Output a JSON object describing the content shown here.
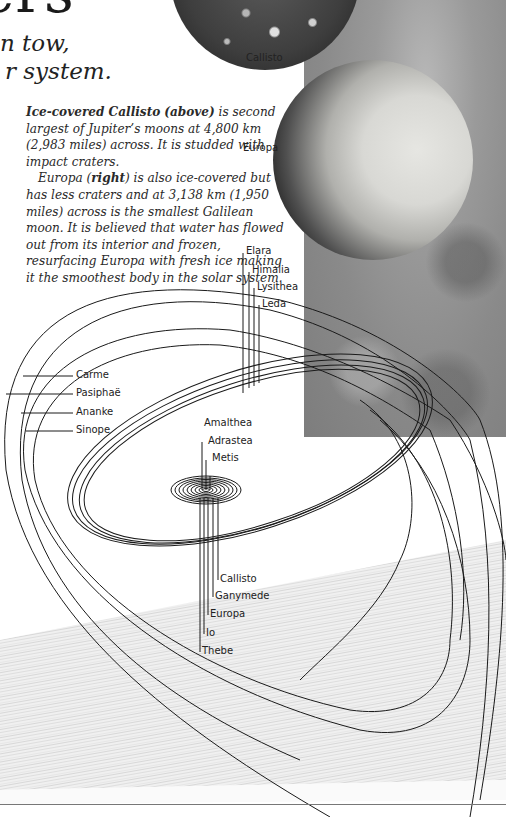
{
  "page": {
    "heading_fragment": "ers",
    "subtitle_lines": [
      "n tow,",
      "r system."
    ]
  },
  "body_text": {
    "para1": {
      "bold": "Ice-covered Callisto",
      "bold2": "(above)",
      "rest": " is second largest of Jupiter’s moons at 4,800 km (2,983 miles) across. It is studded with impact craters."
    },
    "para2": {
      "start": "Europa (",
      "bold": "right",
      "rest": ") is also ice-covered but has less craters and at 3,138 km (1,950 miles) across is the smallest Galilean moon. It is believed that water has flowed out from its interior and frozen, resurfacing Europa with fresh ice making it the smoothest body in the solar system."
    }
  },
  "photo_labels": {
    "callisto": "Callisto",
    "europa": "Europa"
  },
  "orbit_diagram": {
    "outer_prograde": [
      "Elara",
      "Himalia",
      "Lysithea",
      "Leda"
    ],
    "outer_retrograde": [
      "Carme",
      "Pasiphaë",
      "Ananke",
      "Sinope"
    ],
    "inner_small": [
      "Amalthea",
      "Adrastea",
      "Metis"
    ],
    "inner_major": [
      "Callisto",
      "Ganymede",
      "Europa",
      "Io",
      "Thebe"
    ]
  },
  "colors": {
    "text": "#2a2a2a",
    "orbit_line": "#1a1a1a",
    "photo_gray": "#8f8f8f"
  }
}
